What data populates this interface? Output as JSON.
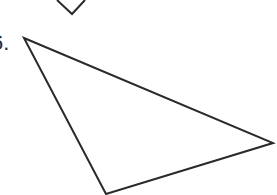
{
  "problem": {
    "number_label": "6.",
    "stroke_color": "#2a2a2a",
    "background": "#ffffff"
  },
  "shapes": {
    "previous_figure_fragment": {
      "type": "polyline",
      "points": "57,0 72,14 85,0"
    },
    "triangle": {
      "type": "polygon",
      "vertices": [
        [
          24,
          38
        ],
        [
          273,
          143
        ],
        [
          106,
          194
        ]
      ]
    }
  }
}
